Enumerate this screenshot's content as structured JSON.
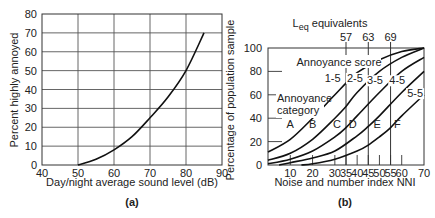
{
  "chart_data": [
    {
      "panel": "(a)",
      "type": "line",
      "title": "",
      "xlabel": "Day/night average sound level (dB)",
      "ylabel": "Percent highly annoyed",
      "xlim": [
        40,
        90
      ],
      "ylim": [
        0,
        80
      ],
      "xticks": [
        40,
        50,
        60,
        70,
        80,
        90
      ],
      "yticks": [
        0,
        10,
        20,
        30,
        40,
        50,
        60,
        70,
        80
      ],
      "grid": true,
      "series": [
        {
          "name": "Percent highly annoyed",
          "x": [
            50,
            55,
            60,
            65,
            70,
            75,
            80,
            85
          ],
          "y": [
            0,
            3,
            8,
            15,
            25,
            36,
            50,
            70
          ]
        }
      ]
    },
    {
      "panel": "(b)",
      "type": "line",
      "title": "",
      "xlabel": "Noise and number index NNI",
      "ylabel": "Percentage of population sample",
      "xlim": [
        0,
        70
      ],
      "ylim": [
        0,
        100
      ],
      "xticks": [
        10,
        20,
        30,
        35,
        40,
        45,
        50,
        55,
        60,
        70
      ],
      "yticks": [
        0,
        20,
        40,
        60,
        80,
        100
      ],
      "grid": false,
      "top_axis": {
        "label": "Leq equivalents",
        "ticks": [
          {
            "nni": 35,
            "label": "57"
          },
          {
            "nni": 45,
            "label": "63"
          },
          {
            "nni": 55,
            "label": "69"
          }
        ]
      },
      "annotations": {
        "score_title": "Annoyance score",
        "category_title": [
          "Annoyance",
          "category"
        ],
        "categories": [
          {
            "label": "A",
            "x": 10,
            "y": 35
          },
          {
            "label": "B",
            "x": 20,
            "y": 35
          },
          {
            "label": "C",
            "x": 31,
            "y": 35
          },
          {
            "label": "D",
            "x": 38,
            "y": 35
          },
          {
            "label": "E",
            "x": 49,
            "y": 35
          },
          {
            "label": "F",
            "x": 58,
            "y": 35
          }
        ]
      },
      "series": [
        {
          "name": "1-5",
          "x": [
            0,
            10,
            20,
            30,
            35,
            40,
            50,
            60,
            70
          ],
          "y": [
            11,
            22,
            40,
            60,
            70,
            79,
            90,
            97,
            100
          ]
        },
        {
          "name": "2-5",
          "x": [
            0,
            10,
            20,
            30,
            35,
            40,
            50,
            60,
            70
          ],
          "y": [
            4,
            10,
            22,
            40,
            50,
            62,
            80,
            92,
            100
          ]
        },
        {
          "name": "3-5",
          "x": [
            0,
            10,
            20,
            30,
            35,
            40,
            50,
            60,
            70
          ],
          "y": [
            1,
            5,
            12,
            24,
            32,
            42,
            62,
            80,
            92
          ]
        },
        {
          "name": "4-5",
          "x": [
            5,
            10,
            20,
            30,
            40,
            45,
            50,
            60,
            70
          ],
          "y": [
            0,
            2,
            6,
            12,
            25,
            33,
            42,
            62,
            80
          ]
        },
        {
          "name": "5-5",
          "x": [
            15,
            20,
            30,
            40,
            45,
            50,
            55,
            60,
            70
          ],
          "y": [
            0,
            1,
            5,
            12,
            17,
            24,
            32,
            42,
            60
          ]
        }
      ],
      "series_label_positions": [
        {
          "name": "1-5",
          "x": 29,
          "y": 71
        },
        {
          "name": "2-5",
          "x": 39,
          "y": 71
        },
        {
          "name": "3-5",
          "x": 48,
          "y": 69
        },
        {
          "name": "4-5",
          "x": 58,
          "y": 69
        },
        {
          "name": "5-5",
          "x": 66,
          "y": 58
        }
      ]
    }
  ]
}
